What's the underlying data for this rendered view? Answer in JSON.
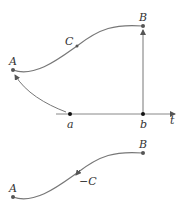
{
  "diagram": {
    "colors": {
      "curve": "#777777",
      "point": "#555555",
      "axis": "#888888",
      "axis_point": "#111111",
      "label": "#333333"
    },
    "top": {
      "start_label": "A",
      "end_label": "B",
      "curve_label": "C"
    },
    "axis": {
      "left_label": "a",
      "right_label": "b",
      "axis_label": "t"
    },
    "bottom": {
      "start_label": "A",
      "end_label": "B",
      "curve_label": "−C"
    }
  }
}
